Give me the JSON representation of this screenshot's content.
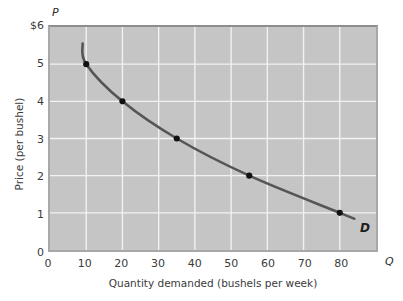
{
  "chart_data": {
    "type": "line",
    "title": "",
    "xlabel": "Quantity demanded (bushels per week)",
    "ylabel": "Price (per bushel)",
    "x_symbol": "Q",
    "y_symbol": "P",
    "series_label": "D",
    "xlim": [
      0,
      90
    ],
    "ylim": [
      0,
      6
    ],
    "grid": true,
    "legend_position": "none",
    "x_ticks": [
      {
        "value": 0,
        "label": "0"
      },
      {
        "value": 10,
        "label": "10"
      },
      {
        "value": 20,
        "label": "20"
      },
      {
        "value": 30,
        "label": "30"
      },
      {
        "value": 40,
        "label": "40"
      },
      {
        "value": 50,
        "label": "50"
      },
      {
        "value": 60,
        "label": "60"
      },
      {
        "value": 70,
        "label": "70"
      },
      {
        "value": 80,
        "label": "80"
      }
    ],
    "y_ticks": [
      {
        "value": 6,
        "label": "$6"
      },
      {
        "value": 5,
        "label": "5"
      },
      {
        "value": 4,
        "label": "4"
      },
      {
        "value": 3,
        "label": "3"
      },
      {
        "value": 2,
        "label": "2"
      },
      {
        "value": 1,
        "label": "1"
      },
      {
        "value": 0,
        "label": "0"
      }
    ],
    "series": [
      {
        "name": "D",
        "points": [
          {
            "x": 10,
            "y": 5
          },
          {
            "x": 20,
            "y": 4
          },
          {
            "x": 35,
            "y": 3
          },
          {
            "x": 55,
            "y": 2
          },
          {
            "x": 80,
            "y": 1
          }
        ],
        "curve_extent": {
          "x_start": 9,
          "x_end": 84
        },
        "marker": "circle",
        "color": "#555555"
      }
    ],
    "colors": {
      "plot_background": "#c5c5c5",
      "gridline": "#f2f2f2",
      "curve": "#555555",
      "marker": "#111111",
      "text": "#3b3b3b",
      "page_background": "#ffffff"
    }
  }
}
